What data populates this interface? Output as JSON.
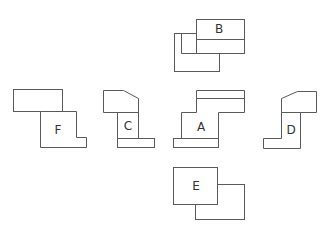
{
  "diagram": {
    "type": "orthographic-projection-views",
    "line_color": "#5a5a5a",
    "background": "#ffffff",
    "views": [
      {
        "id": "B",
        "label": "B",
        "position": "top"
      },
      {
        "id": "F",
        "label": "F",
        "position": "far-left"
      },
      {
        "id": "C",
        "label": "C",
        "position": "left"
      },
      {
        "id": "A",
        "label": "A",
        "position": "center"
      },
      {
        "id": "D",
        "label": "D",
        "position": "right"
      },
      {
        "id": "E",
        "label": "E",
        "position": "bottom"
      }
    ]
  }
}
